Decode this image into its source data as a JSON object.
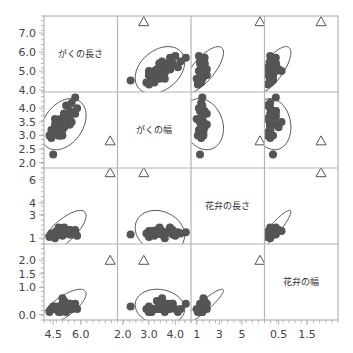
{
  "chart_data": {
    "type": "scatter",
    "subtype": "scatterplot-matrix",
    "title": "",
    "variables": [
      "がくの長さ",
      "がくの幅",
      "花弁の長さ",
      "花弁の幅"
    ],
    "colors": {
      "points": "#555555",
      "ellipse": "#555555",
      "grid": "#b4b4b4",
      "text": "#444444"
    },
    "axes": {
      "left": [
        {
          "range": [
            3.9,
            7.9
          ],
          "ticks": [
            {
              "v": 4.0,
              "label": "4.0"
            },
            {
              "v": 5.0,
              "label": "5.0"
            },
            {
              "v": 6.0,
              "label": "6.0"
            },
            {
              "v": 7.0,
              "label": "7.0"
            }
          ]
        },
        {
          "range": [
            1.8,
            4.6
          ],
          "ticks": [
            {
              "v": 2.0,
              "label": "2.0"
            },
            {
              "v": 2.5,
              "label": "2.5"
            },
            {
              "v": 3.0,
              "label": "3.0"
            },
            {
              "v": 3.5,
              "label": "3.5"
            },
            {
              "v": 4.0,
              "label": "4.0"
            }
          ]
        },
        {
          "range": [
            0.5,
            7.0
          ],
          "ticks": [
            {
              "v": 1,
              "label": "1"
            },
            {
              "v": 3,
              "label": "3"
            },
            {
              "v": 4,
              "label": "4"
            },
            {
              "v": 6,
              "label": "6"
            }
          ]
        },
        {
          "range": [
            -0.2,
            2.6
          ],
          "ticks": [
            {
              "v": 0.0,
              "label": "0.0"
            },
            {
              "v": 1.0,
              "label": "1.0"
            },
            {
              "v": 1.5,
              "label": "1.5"
            },
            {
              "v": 2.0,
              "label": "2.0"
            }
          ]
        }
      ],
      "bottom": [
        {
          "range": [
            4.0,
            8.0
          ],
          "ticks": [
            {
              "v": 4.5,
              "label": "4.5"
            },
            {
              "v": 6.0,
              "label": "6.0"
            }
          ]
        },
        {
          "range": [
            1.8,
            4.6
          ],
          "ticks": [
            {
              "v": 2.0,
              "label": "2.0"
            },
            {
              "v": 3.0,
              "label": "3.0"
            },
            {
              "v": 4.0,
              "label": "4.0"
            }
          ]
        },
        {
          "range": [
            0.5,
            7.0
          ],
          "ticks": [
            {
              "v": 1,
              "label": "1"
            },
            {
              "v": 3,
              "label": "3"
            },
            {
              "v": 5,
              "label": "5"
            }
          ]
        },
        {
          "range": [
            0.0,
            2.6
          ],
          "ticks": [
            {
              "v": 0.5,
              "label": "0.5"
            },
            {
              "v": 1.5,
              "label": "1.5"
            }
          ]
        }
      ]
    },
    "points": [
      [
        5.1,
        3.5,
        1.4,
        0.2
      ],
      [
        4.9,
        3.0,
        1.4,
        0.2
      ],
      [
        4.7,
        3.2,
        1.3,
        0.2
      ],
      [
        4.6,
        3.1,
        1.5,
        0.2
      ],
      [
        5.0,
        3.6,
        1.4,
        0.2
      ],
      [
        5.4,
        3.9,
        1.7,
        0.4
      ],
      [
        4.6,
        3.4,
        1.4,
        0.3
      ],
      [
        5.0,
        3.4,
        1.5,
        0.2
      ],
      [
        4.4,
        2.9,
        1.4,
        0.2
      ],
      [
        4.9,
        3.1,
        1.5,
        0.1
      ],
      [
        5.4,
        3.7,
        1.5,
        0.2
      ],
      [
        4.8,
        3.4,
        1.6,
        0.2
      ],
      [
        4.8,
        3.0,
        1.4,
        0.1
      ],
      [
        4.3,
        3.0,
        1.1,
        0.1
      ],
      [
        5.8,
        4.0,
        1.2,
        0.2
      ],
      [
        5.7,
        4.4,
        1.5,
        0.4
      ],
      [
        5.4,
        3.9,
        1.3,
        0.4
      ],
      [
        5.1,
        3.5,
        1.4,
        0.3
      ],
      [
        5.7,
        3.8,
        1.7,
        0.3
      ],
      [
        5.1,
        3.8,
        1.5,
        0.3
      ],
      [
        5.4,
        3.4,
        1.7,
        0.2
      ],
      [
        5.1,
        3.7,
        1.5,
        0.4
      ],
      [
        4.6,
        3.6,
        1.0,
        0.2
      ],
      [
        5.1,
        3.3,
        1.7,
        0.5
      ],
      [
        4.8,
        3.4,
        1.9,
        0.2
      ],
      [
        5.0,
        3.0,
        1.6,
        0.2
      ],
      [
        5.0,
        3.4,
        1.6,
        0.4
      ],
      [
        5.2,
        3.5,
        1.5,
        0.2
      ],
      [
        5.2,
        3.4,
        1.4,
        0.2
      ],
      [
        4.7,
        3.2,
        1.6,
        0.2
      ],
      [
        4.8,
        3.1,
        1.6,
        0.2
      ],
      [
        5.4,
        3.4,
        1.5,
        0.4
      ],
      [
        5.2,
        4.1,
        1.5,
        0.1
      ],
      [
        5.5,
        4.2,
        1.4,
        0.2
      ],
      [
        4.9,
        3.1,
        1.5,
        0.2
      ],
      [
        5.0,
        3.2,
        1.2,
        0.2
      ],
      [
        5.5,
        3.5,
        1.3,
        0.2
      ],
      [
        4.9,
        3.6,
        1.4,
        0.1
      ],
      [
        4.4,
        3.0,
        1.3,
        0.2
      ],
      [
        5.1,
        3.4,
        1.5,
        0.2
      ],
      [
        5.0,
        3.5,
        1.3,
        0.3
      ],
      [
        4.5,
        2.3,
        1.3,
        0.3
      ],
      [
        4.4,
        3.2,
        1.3,
        0.2
      ],
      [
        5.0,
        3.5,
        1.6,
        0.6
      ],
      [
        5.1,
        3.8,
        1.9,
        0.4
      ],
      [
        4.8,
        3.0,
        1.4,
        0.3
      ],
      [
        5.1,
        3.8,
        1.6,
        0.2
      ],
      [
        4.6,
        3.2,
        1.4,
        0.2
      ],
      [
        5.3,
        3.7,
        1.5,
        0.2
      ],
      [
        5.0,
        3.3,
        1.4,
        0.2
      ]
    ],
    "outlier_marker": {
      "shape": "triangle",
      "values": [
        7.6,
        2.8,
        6.6,
        2.0
      ]
    },
    "density_ellipse": true
  }
}
